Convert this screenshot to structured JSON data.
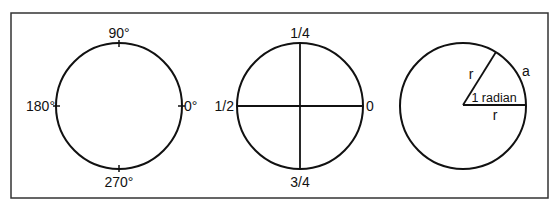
{
  "figure": {
    "frame": {
      "x": 11,
      "y": 13,
      "width": 537,
      "height": 185,
      "stroke": "#333333"
    },
    "stroke_color": "#111111",
    "circles": [
      {
        "name": "degrees",
        "cx": 119,
        "cy": 106,
        "r": 63,
        "labels": {
          "top": "90°",
          "left": "180°",
          "right": "0°",
          "bottom": "270°"
        }
      },
      {
        "name": "fractions",
        "cx": 300,
        "cy": 106,
        "r": 63,
        "labels": {
          "top": "1/4",
          "left": "1/2",
          "right": "0",
          "bottom": "3/4"
        }
      },
      {
        "name": "radian",
        "cx": 463,
        "cy": 105,
        "r": 63,
        "labels": {
          "radius_upper": "r",
          "radius_lower": "r",
          "arc": "a",
          "angle": "1 radian"
        }
      }
    ]
  }
}
